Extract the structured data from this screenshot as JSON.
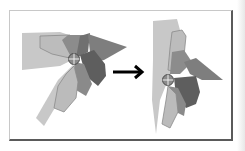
{
  "figure": {
    "colors": {
      "lightest": "#c8c8c8",
      "light": "#b2b2b2",
      "mid": "#8c8c8c",
      "dark": "#6e6e6e",
      "darkest": "#5a5a5a",
      "outline": "#7a7a7a",
      "arrow": "#000000",
      "pivot_fill": "#8a8a8a",
      "pivot_stroke": "#4a4a4a"
    },
    "before": {
      "pivot": [
        74,
        59
      ]
    },
    "after": {
      "pivot": [
        168,
        80
      ]
    },
    "arrow": {
      "from": [
        113,
        72
      ],
      "to": [
        145,
        72
      ],
      "direction": "right"
    }
  }
}
